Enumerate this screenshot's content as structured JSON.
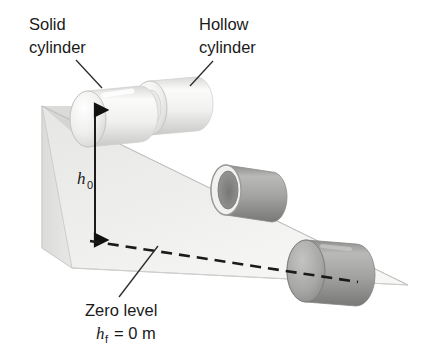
{
  "figure": {
    "background_color": "#ffffff"
  },
  "labels": {
    "solid_cylinder_line1": "Solid",
    "solid_cylinder_line2": "cylinder",
    "hollow_cylinder_line1": "Hollow",
    "hollow_cylinder_line2": "cylinder",
    "zero_level": "Zero level",
    "initial_height_symbol": "h",
    "initial_height_subscript": "0",
    "final_height_symbol": "h",
    "final_height_subscript": "f",
    "final_height_equation": "= 0 m"
  },
  "colors": {
    "ink": "#1a1a1a",
    "ramp_top_face": "#ececeb",
    "ramp_side_face": "#d9d9d8",
    "ramp_front_face": "#e3e3e2",
    "ramp_edge": "#bdbdbc",
    "cylinder_light_body": "#f2f2f1",
    "cylinder_light_shade": "#d6d6d5",
    "cylinder_light_face": "#fafafa",
    "cylinder_dark_body": "#9a9a99",
    "cylinder_dark_shade": "#7e7e7d",
    "cylinder_dark_face": "#b4b4b3",
    "cylinder_bore": "#8d8d8c",
    "dash_color": "#1a1a1a"
  },
  "geometry": {
    "ramp": {
      "top_back_left": [
        42,
        106
      ],
      "top_apex_right": [
        408,
        285
      ],
      "top_front_left": [
        72,
        268
      ],
      "side_bottom_left": [
        42,
        248
      ],
      "description": "wedge with sloping top face descending left-to-right"
    },
    "height_arrow": {
      "x": 95,
      "y_top": 104,
      "y_bottom": 246,
      "double_headed": true
    },
    "zero_level_dash": {
      "start": [
        90,
        241
      ],
      "end": [
        358,
        282
      ]
    },
    "cylinders": [
      {
        "name": "solid-cylinder-top",
        "type": "solid",
        "shade": "light",
        "center": [
          104,
          118
        ],
        "radius": 26,
        "length": 60
      },
      {
        "name": "hollow-cylinder-top",
        "type": "hollow",
        "shade": "light",
        "center": [
          166,
          107
        ],
        "radius": 26,
        "length": 60
      },
      {
        "name": "hollow-cylinder-mid",
        "type": "hollow",
        "shade": "dark",
        "center": [
          247,
          186
        ],
        "radius": 28,
        "length": 56
      },
      {
        "name": "solid-cylinder-bottom",
        "type": "solid",
        "shade": "dark",
        "center": [
          330,
          272
        ],
        "radius": 32,
        "length": 62
      }
    ],
    "leaders": [
      {
        "name": "solid-leader",
        "from": [
          76,
          61
        ],
        "to": [
          101,
          87
        ]
      },
      {
        "name": "hollow-leader",
        "from": [
          212,
          62
        ],
        "to": [
          190,
          85
        ]
      },
      {
        "name": "zero-level-leader",
        "from": [
          120,
          296
        ],
        "to": [
          157,
          247
        ]
      }
    ]
  }
}
